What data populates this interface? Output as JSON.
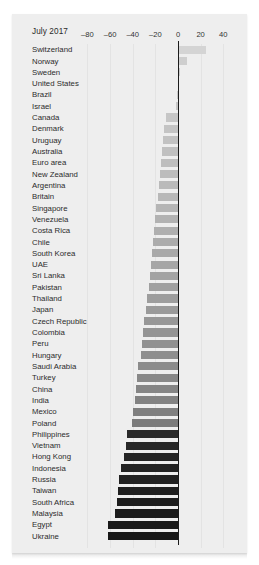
{
  "panel": {
    "period_label": "July 2017",
    "background_color": "#eeeeee",
    "zero_line_color": "#1b1b1b",
    "grid_color": "#e3e3e3"
  },
  "chart_data": {
    "type": "bar",
    "orientation": "horizontal",
    "title": "July 2017",
    "subtitle": "",
    "xlabel": "",
    "ylabel": "",
    "xlim": [
      -90,
      52
    ],
    "ticks": [
      -80,
      -60,
      -40,
      -20,
      0,
      20,
      40
    ],
    "tick_labels": [
      "–80",
      "–60",
      "–40",
      "–20",
      "0",
      "20",
      "40"
    ],
    "grid": true,
    "legend": "none",
    "zero_reference": 0,
    "categories": [
      "Switzerland",
      "Norway",
      "Sweden",
      "United States",
      "Brazil",
      "Israel",
      "Canada",
      "Denmark",
      "Uruguay",
      "Australia",
      "Euro area",
      "New Zealand",
      "Argentina",
      "Britain",
      "Singapore",
      "Venezuela",
      "Costa Rica",
      "Chile",
      "South Korea",
      "UAE",
      "Sri Lanka",
      "Pakistan",
      "Thailand",
      "Japan",
      "Czech Republic",
      "Colombia",
      "Peru",
      "Hungary",
      "Saudi Arabia",
      "Turkey",
      "China",
      "India",
      "Mexico",
      "Poland",
      "Philippines",
      "Vietnam",
      "Hong Kong",
      "Indonesia",
      "Russia",
      "Taiwan",
      "South Africa",
      "Malaysia",
      "Egypt",
      "Ukraine"
    ],
    "values": [
      25,
      8,
      2,
      0,
      -1,
      -2,
      -11,
      -12,
      -13,
      -14,
      -15,
      -16,
      -17,
      -18,
      -19,
      -20,
      -21,
      -22,
      -23,
      -24,
      -25,
      -26,
      -27,
      -28,
      -30,
      -31,
      -32,
      -33,
      -35,
      -36,
      -37,
      -38,
      -40,
      -41,
      -45,
      -46,
      -48,
      -50,
      -52,
      -53,
      -54,
      -56,
      -62,
      -62
    ],
    "bar_colors": [
      "#d4d4d4",
      "#cecece",
      "#cacaca",
      "#c9c9c9",
      "#c8c8c8",
      "#c7c7c7",
      "#c6c6c6",
      "#c4c4c4",
      "#c2c2c2",
      "#c0c0c0",
      "#bebebe",
      "#bcbcbc",
      "#bababa",
      "#b8b8b8",
      "#b5b5b5",
      "#b2b2b2",
      "#afafaf",
      "#acacac",
      "#a9a9a9",
      "#a6a6a6",
      "#a3a3a3",
      "#a0a0a0",
      "#9d9d9d",
      "#9a9a9a",
      "#979797",
      "#949494",
      "#919191",
      "#8e8e8e",
      "#8b8b8b",
      "#888888",
      "#858585",
      "#828282",
      "#7f7f7f",
      "#7c7c7c",
      "#2a2a2a",
      "#272727",
      "#252525",
      "#232323",
      "#212121",
      "#1f1f1f",
      "#1d1d1d",
      "#1b1b1b",
      "#191919",
      "#171717"
    ]
  }
}
